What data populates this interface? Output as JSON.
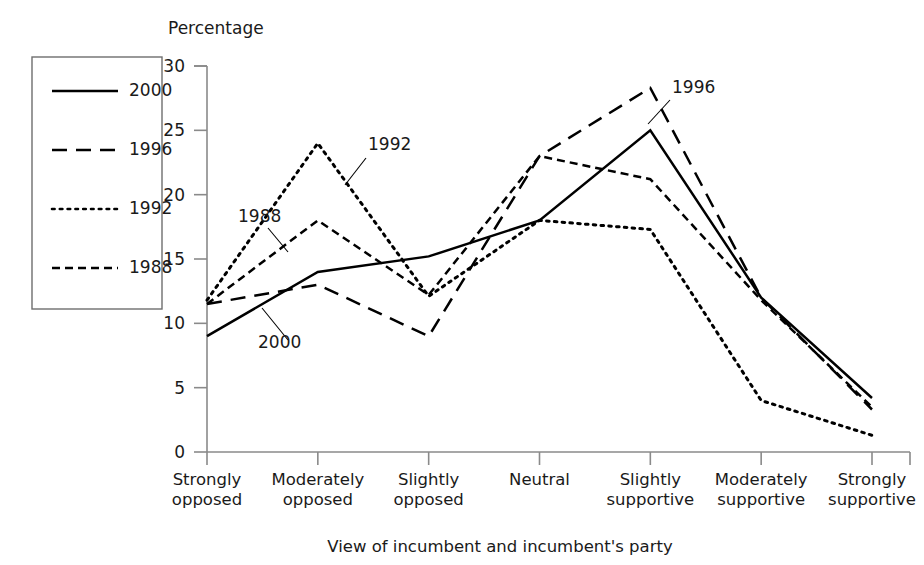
{
  "chart_data": {
    "type": "line",
    "title": "",
    "ylabel": "Percentage",
    "xlabel": "View of incumbent and incumbent's party",
    "categories": [
      "Strongly\nopposed",
      "Moderately\nopposed",
      "Slightly\nopposed",
      "Neutral",
      "Slightly\nsupportive",
      "Moderately\nsupportive",
      "Strongly\nsupportive"
    ],
    "category_lines": [
      [
        "Strongly",
        "opposed"
      ],
      [
        "Moderately",
        "opposed"
      ],
      [
        "Slightly",
        "opposed"
      ],
      [
        "Neutral",
        ""
      ],
      [
        "Slightly",
        "supportive"
      ],
      [
        "Moderately",
        "supportive"
      ],
      [
        "Strongly",
        "supportive"
      ]
    ],
    "ylim": [
      0,
      30
    ],
    "yticks": [
      0,
      5,
      10,
      15,
      20,
      25,
      30
    ],
    "grid": false,
    "legend_position": "outside-left",
    "series": [
      {
        "name": "2000",
        "dash": "solid",
        "values": [
          9.0,
          14.0,
          15.2,
          18.0,
          25.0,
          12.0,
          4.2
        ]
      },
      {
        "name": "1996",
        "dash": "long-dash",
        "values": [
          11.5,
          13.0,
          9.0,
          23.0,
          28.3,
          12.0,
          3.3
        ]
      },
      {
        "name": "1992",
        "dash": "dotted",
        "values": [
          11.8,
          24.0,
          12.1,
          18.0,
          17.3,
          4.0,
          1.3
        ]
      },
      {
        "name": "1988",
        "dash": "medium-dash",
        "values": [
          11.5,
          18.0,
          12.2,
          23.0,
          21.2,
          11.8,
          3.5
        ]
      }
    ],
    "annotations": [
      {
        "label": "1992",
        "x": 368,
        "y": 150,
        "leader": [
          [
            366,
            158
          ],
          [
            345,
            185
          ]
        ]
      },
      {
        "label": "1988",
        "x": 238,
        "y": 222,
        "leader": [
          [
            268,
            228
          ],
          [
            288,
            252
          ]
        ]
      },
      {
        "label": "2000",
        "x": 258,
        "y": 348,
        "leader": [
          [
            288,
            340
          ],
          [
            262,
            308
          ]
        ]
      },
      {
        "label": "1996",
        "x": 672,
        "y": 93,
        "leader": [
          [
            670,
            100
          ],
          [
            648,
            124
          ]
        ]
      }
    ]
  },
  "legend": {
    "entries": [
      {
        "label": "2000"
      },
      {
        "label": "1996"
      },
      {
        "label": "1992"
      },
      {
        "label": "1988"
      }
    ]
  },
  "axis": {
    "y_title": "Percentage",
    "x_title": "View of incumbent and incumbent's party",
    "y_tick_labels": [
      "0",
      "5",
      "10",
      "15",
      "20",
      "25",
      "30"
    ]
  },
  "colors": {
    "line": "#000000",
    "axis": "#8a8a8a",
    "text": "#1a1a1a",
    "background": "#ffffff"
  }
}
